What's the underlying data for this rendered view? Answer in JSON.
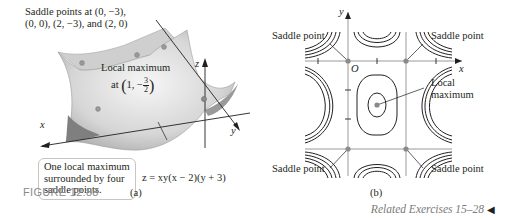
{
  "figure": {
    "number_label": "FIGURE 12.88",
    "related_exercises": "Related Exercises 15–28",
    "related_arrow_icon": "◀"
  },
  "panel_a": {
    "sublabel": "(a)",
    "saddle_note_line1": "Saddle points at (0, −3),",
    "saddle_note_line2": "(0, 0), (2, −3), and (2, 0)",
    "local_max_label": "Local maximum",
    "local_max_at": "at",
    "local_max_x": "1,",
    "local_max_y_sign": "−",
    "local_max_y_num": "3",
    "local_max_y_den": "2",
    "equation": "z = xy(x − 2)(y + 3)",
    "axis_x": "x",
    "axis_y": "y",
    "axis_z": "z",
    "callout": "One local maximum surrounded by four saddle points.",
    "colors": {
      "surface_light": "#f2f2f2",
      "surface_mid": "#c8c8c8",
      "surface_dark": "#8e8e8e",
      "point": "#9a9a9a"
    }
  },
  "panel_b": {
    "sublabel": "(b)",
    "axis_x": "x",
    "axis_y": "y",
    "origin": "O",
    "saddle_top_left": "Saddle point",
    "saddle_top_right": "Saddle point",
    "saddle_bottom_left": "Saddle point",
    "saddle_bottom_right": "Saddle point",
    "local_max_line1": "Local",
    "local_max_line2": "maximum",
    "colors": {
      "contour": "#231f20",
      "grid": "#9a9a9a",
      "point": "#8a8a8a"
    }
  }
}
